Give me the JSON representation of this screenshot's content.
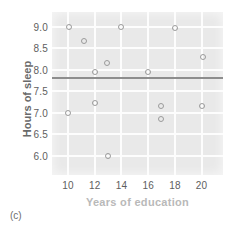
{
  "figure": {
    "panel_label": "(c)",
    "background_color": "#e9e9e9",
    "gridline_color": "#fdfdfd",
    "marker_color": "#9b9b9b",
    "fitline_color": "#8d8d8d"
  },
  "chart_data": {
    "type": "scatter",
    "title": "",
    "xlabel": "Years of education",
    "ylabel": "Hours of sleep",
    "xlim": [
      8.8,
      21.6
    ],
    "ylim": [
      5.55,
      9.35
    ],
    "xticks": [
      10,
      12,
      14,
      16,
      18,
      20
    ],
    "xticklabels": [
      "10",
      "12",
      "14",
      "16",
      "18",
      "20"
    ],
    "yticks": [
      6.0,
      6.5,
      7.0,
      7.5,
      8.0,
      8.5,
      9.0
    ],
    "yticklabels": [
      "6.0",
      "6.5",
      "7.0",
      "7.5",
      "8.0",
      "8.5",
      "9.0"
    ],
    "grid": true,
    "legend": false,
    "points": [
      {
        "x": 10.1,
        "y": 9.0
      },
      {
        "x": 10.0,
        "y": 7.0
      },
      {
        "x": 11.2,
        "y": 8.67
      },
      {
        "x": 12.0,
        "y": 7.96
      },
      {
        "x": 12.0,
        "y": 7.23
      },
      {
        "x": 12.9,
        "y": 8.17
      },
      {
        "x": 13.0,
        "y": 6.0
      },
      {
        "x": 14.0,
        "y": 9.0
      },
      {
        "x": 16.0,
        "y": 7.96
      },
      {
        "x": 16.95,
        "y": 7.16
      },
      {
        "x": 16.95,
        "y": 6.85
      },
      {
        "x": 18.0,
        "y": 8.98
      },
      {
        "x": 20.1,
        "y": 8.29
      },
      {
        "x": 20.0,
        "y": 7.15
      }
    ],
    "annotations": [
      {
        "kind": "horizontal-line",
        "y": 7.8,
        "label": "regression line"
      }
    ]
  }
}
